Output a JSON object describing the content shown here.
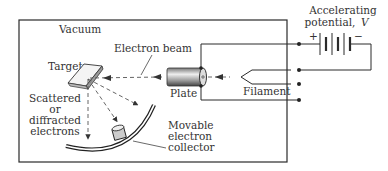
{
  "labels": {
    "vacuum": "Vacuum",
    "electron_beam": "Electron beam",
    "target": "Target",
    "scattered_1": "Scattered",
    "scattered_2": "or",
    "scattered_3": "diffracted",
    "scattered_4": "electrons",
    "plate": "Plate",
    "filament": "Filament",
    "collector_1": "Movable",
    "collector_2": "electron",
    "collector_3": "collector",
    "potential_1": "Accelerating",
    "potential_2": "potential,",
    "potential_var": "V",
    "plus": "+",
    "minus": "−"
  },
  "colors": {
    "ink": "#2a2a2a",
    "background": "#ffffff"
  }
}
